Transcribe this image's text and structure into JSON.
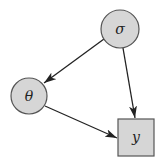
{
  "diagram": {
    "type": "directed graphical model",
    "colors": {
      "node_fill": "#d6d6d6",
      "node_stroke": "#555555",
      "edge": "#222222",
      "background": "#ffffff"
    },
    "nodes": [
      {
        "id": "sigma",
        "label": "σ",
        "shape": "circle"
      },
      {
        "id": "theta",
        "label": "θ",
        "shape": "circle"
      },
      {
        "id": "y",
        "label": "y",
        "shape": "square"
      }
    ],
    "edges": [
      {
        "from": "sigma",
        "to": "theta"
      },
      {
        "from": "sigma",
        "to": "y"
      },
      {
        "from": "theta",
        "to": "y"
      }
    ]
  }
}
